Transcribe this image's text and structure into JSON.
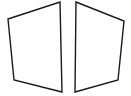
{
  "figure": {
    "background_color": "#ffffff",
    "stroke_color": "#1a1a1a",
    "fill_color": "#ffffff",
    "stroke_width": 1.4,
    "canvas": {
      "width": 131,
      "height": 96
    },
    "shapes": [
      {
        "name": "left-panel",
        "label": "Left quadrilateral",
        "sides": 4,
        "points": "8,19 60,2 62,92 14,80",
        "vertices": [
          {
            "x": 8,
            "y": 19,
            "corner": "top-left"
          },
          {
            "x": 60,
            "y": 2,
            "corner": "top-right"
          },
          {
            "x": 62,
            "y": 92,
            "corner": "bottom-right"
          },
          {
            "x": 14,
            "y": 80,
            "corner": "bottom-left"
          }
        ]
      },
      {
        "name": "right-panel",
        "label": "Right quadrilateral",
        "sides": 4,
        "points": "76,2 124,21 118,80 75,92",
        "vertices": [
          {
            "x": 76,
            "y": 2,
            "corner": "top-left"
          },
          {
            "x": 124,
            "y": 21,
            "corner": "top-right"
          },
          {
            "x": 118,
            "y": 80,
            "corner": "bottom-right"
          },
          {
            "x": 75,
            "y": 92,
            "corner": "bottom-left"
          }
        ]
      }
    ]
  },
  "chart_data": {
    "type": "scatter",
    "xlabel": "",
    "ylabel": "",
    "xlim": [
      0,
      131
    ],
    "ylim": [
      0,
      96
    ],
    "grid": false,
    "legend": "none",
    "series": [
      {
        "name": "left-panel",
        "x": [
          8,
          60,
          62,
          14,
          8
        ],
        "y": [
          19,
          2,
          92,
          80,
          19
        ]
      },
      {
        "name": "right-panel",
        "x": [
          76,
          124,
          118,
          75,
          76
        ],
        "y": [
          2,
          21,
          80,
          92,
          2
        ]
      }
    ]
  }
}
